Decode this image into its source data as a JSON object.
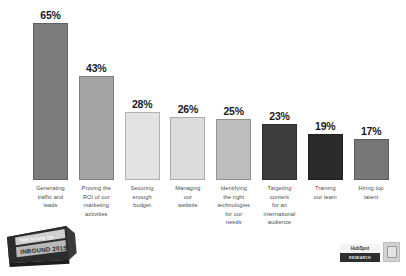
{
  "chart_data": {
    "type": "bar",
    "title": "",
    "xlabel": "",
    "ylabel": "",
    "ylim": [
      0,
      70
    ],
    "grid": false,
    "legend": null,
    "categories": [
      "Generating traffic and leads",
      "Proving the ROI of our marketing activities",
      "Securing enough budget",
      "Managing our website",
      "Identifying the right technologies for our needs",
      "Targeting content for an international audience",
      "Training our team",
      "Hiring top talent"
    ],
    "category_lines": [
      [
        "Generating",
        "traffic and",
        "leads"
      ],
      [
        "Proving the",
        "ROI of our",
        "marketing",
        "activities"
      ],
      [
        "Securing",
        "enough",
        "budget"
      ],
      [
        "Managing",
        "our",
        "website"
      ],
      [
        "Identifying",
        "the right",
        "technologies",
        "for our",
        "needs"
      ],
      [
        "Targeting",
        "content",
        "for an",
        "international",
        "audience"
      ],
      [
        "Training",
        "our team"
      ],
      [
        "Hiring top",
        "talent"
      ]
    ],
    "values": [
      65,
      43,
      28,
      26,
      25,
      23,
      19,
      17
    ],
    "value_labels": [
      "65%",
      "43%",
      "28%",
      "26%",
      "25%",
      "23%",
      "19%",
      "17%"
    ],
    "bar_colors": [
      "#7c7c7c",
      "#a3a3a3",
      "#e3e3e3",
      "#dcdcdc",
      "#bdbdbd",
      "#3d3d3d",
      "#2a2a2a",
      "#777777"
    ]
  },
  "branding": {
    "badge_line1": "THE STATE OF",
    "badge_line2": "INBOUND 2015",
    "logo_name": "HubSpot",
    "logo_sub": "RESEARCH",
    "footnote": ""
  }
}
